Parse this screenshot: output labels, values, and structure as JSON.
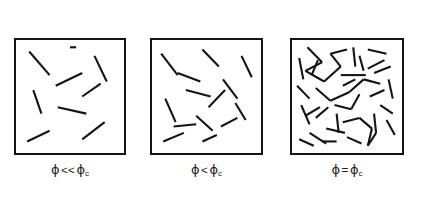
{
  "figure": {
    "title": "",
    "background_color": "#ffffff",
    "stick_color": "#141414",
    "border_color": "#141414",
    "width": 422,
    "height": 200,
    "top_partial_text": "",
    "panels": [
      {
        "id": "panel-dilute",
        "caption_phi": "ϕ",
        "caption_relation": "<<",
        "caption_phi_c": "ϕ",
        "caption_subscript": "c",
        "caption_full": "ϕ << ϕc",
        "regime": "dilute",
        "stick_count": 9,
        "box": {
          "x": 14,
          "y": 38,
          "w": 112,
          "h": 117
        },
        "caption_pos": {
          "x": 14,
          "y": 163,
          "w": 112
        },
        "sticks": [
          [
            0.1,
            0.08,
            0.3,
            0.3
          ],
          [
            0.74,
            0.12,
            0.86,
            0.36
          ],
          [
            0.36,
            0.4,
            0.62,
            0.28
          ],
          [
            0.14,
            0.44,
            0.22,
            0.66
          ],
          [
            0.62,
            0.5,
            0.8,
            0.38
          ],
          [
            0.38,
            0.6,
            0.66,
            0.66
          ],
          [
            0.62,
            0.9,
            0.84,
            0.74
          ],
          [
            0.08,
            0.92,
            0.3,
            0.82
          ],
          [
            0.5,
            0.04,
            0.56,
            0.04
          ]
        ]
      },
      {
        "id": "panel-subcritical",
        "caption_phi": "ϕ",
        "caption_relation": "<",
        "caption_phi_c": "ϕ",
        "caption_subscript": "c",
        "caption_full": "ϕ < ϕc",
        "regime": "sub-critical",
        "stick_count": 14,
        "box": {
          "x": 150,
          "y": 38,
          "w": 113,
          "h": 117
        },
        "caption_pos": {
          "x": 150,
          "y": 163,
          "w": 113
        },
        "caption_pos_note": "",
        "sticks": [
          [
            0.06,
            0.1,
            0.22,
            0.3
          ],
          [
            0.46,
            0.06,
            0.62,
            0.22
          ],
          [
            0.84,
            0.12,
            0.94,
            0.32
          ],
          [
            0.22,
            0.28,
            0.44,
            0.36
          ],
          [
            0.3,
            0.44,
            0.54,
            0.5
          ],
          [
            0.66,
            0.34,
            0.8,
            0.52
          ],
          [
            0.1,
            0.52,
            0.2,
            0.74
          ],
          [
            0.52,
            0.6,
            0.68,
            0.44
          ],
          [
            0.78,
            0.56,
            0.88,
            0.72
          ],
          [
            0.4,
            0.68,
            0.56,
            0.82
          ],
          [
            0.18,
            0.78,
            0.4,
            0.76
          ],
          [
            0.64,
            0.78,
            0.8,
            0.7
          ],
          [
            0.08,
            0.92,
            0.28,
            0.84
          ],
          [
            0.46,
            0.92,
            0.6,
            0.86
          ]
        ]
      },
      {
        "id": "panel-critical",
        "caption_phi": "ϕ",
        "caption_relation": "=",
        "caption_phi_c": "ϕ",
        "caption_subscript": "c",
        "caption_full": "ϕ = ϕc",
        "regime": "percolation-threshold",
        "stick_count": 40,
        "box": {
          "x": 290,
          "y": 38,
          "w": 114,
          "h": 117
        },
        "caption_pos": {
          "x": 290,
          "y": 163,
          "w": 114
        },
        "sticks": [
          [
            0.12,
            0.04,
            0.26,
            0.18
          ],
          [
            0.26,
            0.18,
            0.1,
            0.26
          ],
          [
            0.1,
            0.26,
            0.28,
            0.36
          ],
          [
            0.28,
            0.36,
            0.44,
            0.22
          ],
          [
            0.44,
            0.22,
            0.34,
            0.1
          ],
          [
            0.34,
            0.1,
            0.5,
            0.06
          ],
          [
            0.56,
            0.04,
            0.58,
            0.22
          ],
          [
            0.7,
            0.06,
            0.88,
            0.1
          ],
          [
            0.86,
            0.16,
            0.7,
            0.24
          ],
          [
            0.04,
            0.14,
            0.08,
            0.34
          ],
          [
            0.02,
            0.4,
            0.14,
            0.52
          ],
          [
            0.2,
            0.42,
            0.34,
            0.54
          ],
          [
            0.34,
            0.54,
            0.52,
            0.46
          ],
          [
            0.52,
            0.46,
            0.66,
            0.34
          ],
          [
            0.66,
            0.34,
            0.82,
            0.38
          ],
          [
            0.44,
            0.3,
            0.68,
            0.3
          ],
          [
            0.76,
            0.28,
            0.92,
            0.22
          ],
          [
            0.9,
            0.34,
            0.94,
            0.52
          ],
          [
            0.38,
            0.58,
            0.54,
            0.62
          ],
          [
            0.54,
            0.62,
            0.62,
            0.48
          ],
          [
            0.24,
            0.6,
            0.1,
            0.68
          ],
          [
            0.06,
            0.58,
            0.14,
            0.76
          ],
          [
            0.2,
            0.7,
            0.32,
            0.6
          ],
          [
            0.4,
            0.66,
            0.42,
            0.84
          ],
          [
            0.46,
            0.74,
            0.62,
            0.7
          ],
          [
            0.62,
            0.7,
            0.74,
            0.8
          ],
          [
            0.74,
            0.8,
            0.7,
            0.96
          ],
          [
            0.7,
            0.96,
            0.78,
            0.84
          ],
          [
            0.78,
            0.84,
            0.76,
            0.66
          ],
          [
            0.82,
            0.58,
            0.94,
            0.66
          ],
          [
            0.88,
            0.72,
            0.96,
            0.86
          ],
          [
            0.3,
            0.8,
            0.48,
            0.84
          ],
          [
            0.14,
            0.84,
            0.3,
            0.94
          ],
          [
            0.04,
            0.9,
            0.18,
            0.96
          ],
          [
            0.5,
            0.88,
            0.64,
            0.94
          ],
          [
            0.58,
            0.34,
            0.46,
            0.4
          ],
          [
            0.16,
            0.3,
            0.22,
            0.16
          ],
          [
            0.62,
            0.12,
            0.66,
            0.26
          ],
          [
            0.86,
            0.44,
            0.72,
            0.5
          ],
          [
            0.26,
            0.92,
            0.4,
            0.92
          ]
        ]
      }
    ]
  }
}
